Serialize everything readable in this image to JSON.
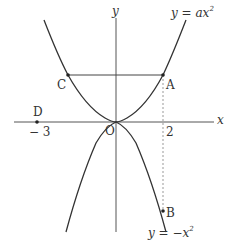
{
  "diagram": {
    "axes": {
      "x_label": "x",
      "y_label": "y",
      "origin_label": "O"
    },
    "curves": [
      {
        "name": "upper-parabola",
        "equation_lhs": "y = ax",
        "exponent": "2"
      },
      {
        "name": "lower-parabola",
        "equation_lhs": "y = −x",
        "exponent": "2"
      }
    ],
    "points": {
      "A": "A",
      "B": "B",
      "C": "C",
      "D": "D"
    },
    "ticks": {
      "x_2": "2",
      "x_neg3": "− 3"
    },
    "colors": {
      "line": "#333333",
      "dashed": "#999999",
      "background": "#ffffff"
    }
  }
}
